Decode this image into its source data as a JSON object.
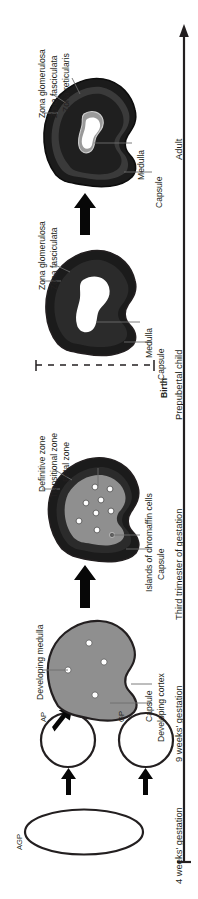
{
  "figure": {
    "orientation": "rotated-90-ccw",
    "background": "#ffffff",
    "ink": "#231f20"
  },
  "timeline": {
    "name": "developmental-timeline-axis",
    "direction": "upward-arrow",
    "stages": [
      {
        "id": "stage-4weeks",
        "label": "4 weeks' gestation"
      },
      {
        "id": "stage-9weeks",
        "label": "9 weeks' gestation"
      },
      {
        "id": "stage-third-trimester",
        "label": "Third trimester of gestation"
      },
      {
        "id": "stage-prepubertal",
        "label": "Prepubertal child"
      },
      {
        "id": "stage-adult",
        "label": "Adult"
      }
    ],
    "birth_marker": {
      "id": "birth-marker",
      "label": "Birth",
      "style": "dashed"
    }
  },
  "structures": {
    "agp": {
      "id": "agp-primordium",
      "label": "AGP"
    },
    "ap": {
      "id": "ap-primordium",
      "label": "AP"
    },
    "gp": {
      "id": "gp-primordium",
      "label": "GP"
    }
  },
  "labels": {
    "developing_medulla": "Developing medulla",
    "capsule": "Capsule",
    "developing_cortex": "Developing cortex",
    "definitive_zone": "Definitive zone",
    "transitional_zone": "Transitional zone",
    "fetal_zone": "Fetal zone",
    "islands_of_chromaffin_cells": "Islands of chromaffin cells",
    "medulla": "Medulla",
    "zona_glomerulosa": "Zona glomerulosa",
    "zona_fasciculata": "Zona fasciculata",
    "zona_reticularis": "Zona reticularis"
  },
  "colors": {
    "outline": "#231f20",
    "capsule_dark": "#1b1b1b",
    "cortex_grey": "#8f8f8f",
    "zone_mid": "#2b2b2b",
    "medulla_white": "#ffffff",
    "medulla_grey": "#9a9a9a",
    "leader_line": "#6d6d6d",
    "white": "#ffffff"
  },
  "glands": [
    {
      "id": "gland-adult",
      "stage": "Adult",
      "zones": [
        "Capsule",
        "Zona glomerulosa",
        "Zona fasciculata",
        "Zona reticularis",
        "Medulla"
      ]
    },
    {
      "id": "gland-prepubertal",
      "stage": "Prepubertal child",
      "zones": [
        "Capsule",
        "Zona glomerulosa",
        "Zona fasciculata",
        "Medulla"
      ]
    },
    {
      "id": "gland-third-trimester",
      "stage": "Third trimester of gestation",
      "zones": [
        "Capsule",
        "Definitive zone",
        "Transitional zone",
        "Fetal zone",
        "Islands of chromaffin cells"
      ],
      "chromaffin_islands": 8
    },
    {
      "id": "gland-9weeks",
      "stage": "9 weeks' gestation",
      "zones": [
        "Capsule",
        "Developing cortex",
        "Developing medulla"
      ],
      "medulla_cells": 4
    }
  ]
}
